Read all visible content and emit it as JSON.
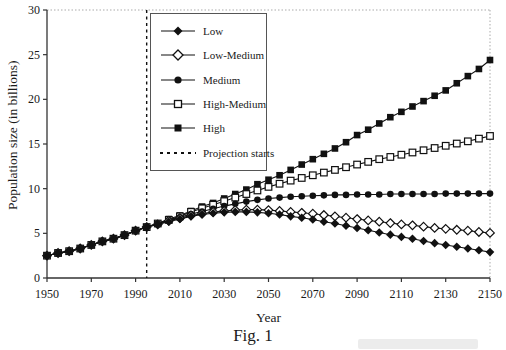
{
  "figure": {
    "caption": "Fig. 1",
    "xlabel": "Year",
    "ylabel": "Population size (in billions)"
  },
  "legend": {
    "entries": [
      {
        "label": "Low",
        "marker": "filled-diamond"
      },
      {
        "label": "Low-Medium",
        "marker": "open-diamond"
      },
      {
        "label": "Medium",
        "marker": "filled-circle"
      },
      {
        "label": "High-Medium",
        "marker": "open-square"
      },
      {
        "label": "High",
        "marker": "filled-square"
      },
      {
        "label": "Projection starts",
        "marker": "dashed-line"
      }
    ]
  },
  "colors": {
    "series": "#111111",
    "axis": "#333333",
    "frame_dotted": "#aaaaaa",
    "text": "#1a1a1a",
    "background": "#ffffff"
  },
  "chart_data": {
    "type": "line",
    "title": "Fig. 1",
    "xlabel": "Year",
    "ylabel": "Population size (in billions)",
    "xlim": [
      1950,
      2150
    ],
    "ylim": [
      0,
      30
    ],
    "xticks": [
      1950,
      1970,
      1990,
      2010,
      2030,
      2050,
      2070,
      2090,
      2110,
      2130,
      2150
    ],
    "yticks": [
      0,
      5,
      10,
      15,
      20,
      25,
      30
    ],
    "grid": false,
    "legend_position": "upper-left-inside",
    "annotation": {
      "label": "Projection starts",
      "x": 1995,
      "style": "vertical-dashed-line"
    },
    "x": [
      1950,
      1955,
      1960,
      1965,
      1970,
      1975,
      1980,
      1985,
      1990,
      1995,
      2000,
      2005,
      2010,
      2015,
      2020,
      2025,
      2030,
      2035,
      2040,
      2045,
      2050,
      2055,
      2060,
      2065,
      2070,
      2075,
      2080,
      2085,
      2090,
      2095,
      2100,
      2105,
      2110,
      2115,
      2120,
      2125,
      2130,
      2135,
      2140,
      2145,
      2150
    ],
    "series": [
      {
        "name": "Low",
        "marker": "filled-diamond",
        "values": [
          2.5,
          2.8,
          3.0,
          3.3,
          3.7,
          4.1,
          4.4,
          4.8,
          5.3,
          5.7,
          6.0,
          6.3,
          6.6,
          6.9,
          7.1,
          7.25,
          7.35,
          7.4,
          7.4,
          7.35,
          7.25,
          7.1,
          6.9,
          6.75,
          6.55,
          6.3,
          6.1,
          5.85,
          5.6,
          5.35,
          5.1,
          4.85,
          4.6,
          4.4,
          4.15,
          3.9,
          3.7,
          3.5,
          3.3,
          3.1,
          2.9
        ]
      },
      {
        "name": "Low-Medium",
        "marker": "open-diamond",
        "values": [
          2.5,
          2.8,
          3.0,
          3.3,
          3.7,
          4.1,
          4.4,
          4.8,
          5.3,
          5.7,
          6.0,
          6.4,
          6.7,
          7.0,
          7.2,
          7.4,
          7.5,
          7.6,
          7.65,
          7.65,
          7.6,
          7.5,
          7.4,
          7.3,
          7.2,
          7.05,
          6.9,
          6.75,
          6.6,
          6.45,
          6.3,
          6.15,
          6.0,
          5.9,
          5.75,
          5.6,
          5.5,
          5.4,
          5.3,
          5.15,
          5.05
        ]
      },
      {
        "name": "Medium",
        "marker": "filled-circle",
        "values": [
          2.5,
          2.8,
          3.0,
          3.3,
          3.7,
          4.1,
          4.4,
          4.8,
          5.3,
          5.7,
          6.1,
          6.45,
          6.8,
          7.15,
          7.45,
          7.75,
          8.05,
          8.3,
          8.55,
          8.75,
          8.9,
          9.0,
          9.1,
          9.15,
          9.2,
          9.25,
          9.3,
          9.3,
          9.35,
          9.35,
          9.35,
          9.4,
          9.4,
          9.4,
          9.4,
          9.4,
          9.45,
          9.45,
          9.45,
          9.45,
          9.45
        ]
      },
      {
        "name": "High-Medium",
        "marker": "open-square",
        "values": [
          2.5,
          2.8,
          3.0,
          3.3,
          3.7,
          4.1,
          4.4,
          4.8,
          5.3,
          5.7,
          6.1,
          6.5,
          6.9,
          7.4,
          7.8,
          8.2,
          8.6,
          9.0,
          9.4,
          9.8,
          10.2,
          10.55,
          10.9,
          11.2,
          11.5,
          11.8,
          12.1,
          12.4,
          12.7,
          13.0,
          13.3,
          13.55,
          13.8,
          14.05,
          14.3,
          14.55,
          14.8,
          15.05,
          15.3,
          15.6,
          15.9
        ]
      },
      {
        "name": "High",
        "marker": "filled-square",
        "values": [
          2.5,
          2.8,
          3.0,
          3.3,
          3.7,
          4.1,
          4.4,
          4.8,
          5.3,
          5.7,
          6.1,
          6.6,
          7.0,
          7.5,
          8.0,
          8.4,
          8.9,
          9.4,
          9.9,
          10.5,
          11.0,
          11.5,
          12.1,
          12.7,
          13.3,
          13.9,
          14.5,
          15.2,
          16.0,
          16.6,
          17.3,
          18.0,
          18.6,
          19.2,
          19.8,
          20.4,
          21.0,
          21.8,
          22.6,
          23.4,
          24.4
        ]
      }
    ]
  }
}
